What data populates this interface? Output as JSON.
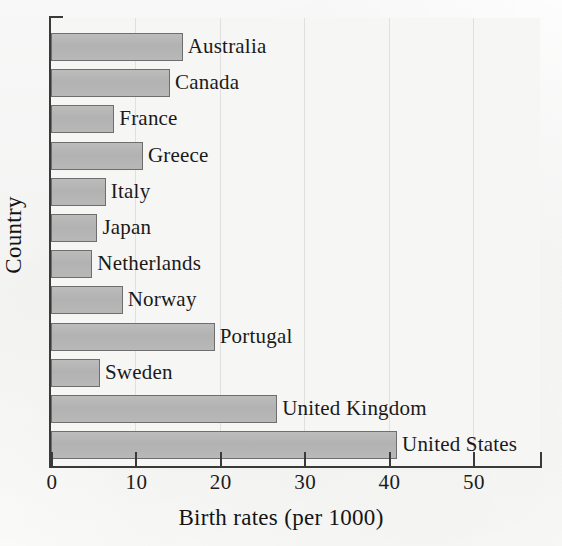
{
  "chart_data": {
    "type": "bar",
    "orientation": "horizontal",
    "title": "",
    "xlabel": "Birth rates (per 1000)",
    "ylabel": "Country",
    "categories": [
      "Australia",
      "Canada",
      "France",
      "Greece",
      "Italy",
      "Japan",
      "Netherlands",
      "Norway",
      "Portugal",
      "Sweden",
      "United Kingdom",
      "United States"
    ],
    "values": [
      15.6,
      14.1,
      7.5,
      10.9,
      6.5,
      5.5,
      4.9,
      8.5,
      19.4,
      5.8,
      26.8,
      41.0
    ],
    "xlim": [
      0,
      58
    ],
    "xticks": [
      0,
      10,
      20,
      30,
      40,
      50
    ],
    "xticklabels": [
      "0",
      "10",
      "20",
      "30",
      "40",
      "50"
    ],
    "grid": "vertical-faint",
    "legend": "none",
    "bar_fill_color": "#b5b5b5",
    "bar_edge_color": "#6e6e6e",
    "background_color": "#f6f6f5",
    "axis_color": "#3a3a3a"
  }
}
